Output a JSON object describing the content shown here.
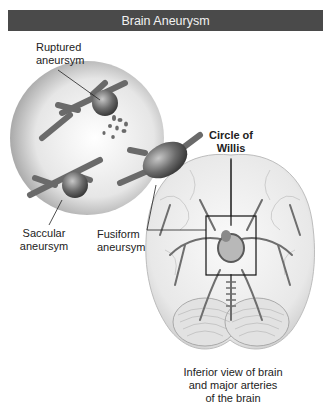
{
  "header": {
    "title": "Brain Aneurysm"
  },
  "labels": {
    "ruptured": [
      "Ruptured",
      "aneursym"
    ],
    "saccular": [
      "Saccular",
      "aneursym"
    ],
    "fusiform": [
      "Fusiform",
      "aneursym"
    ],
    "circle_of_willis": [
      "Circle of",
      "Willis"
    ],
    "caption": [
      "Inferior view of brain",
      "and major arteries",
      "of the brain"
    ]
  },
  "colors": {
    "header_bg": "#4a4a4a",
    "header_text": "#f2f2f2",
    "vessel": "#6b6b6b",
    "aneurysm": "#5a5a5a",
    "magnifier_circle": "#d8d8d8",
    "brain": "#ececec"
  }
}
